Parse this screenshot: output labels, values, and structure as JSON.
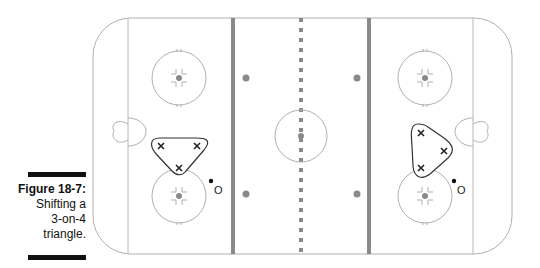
{
  "figure": {
    "label": "Figure 18-7:",
    "caption_lines": [
      "Shifting a",
      "3-on-4",
      "triangle."
    ]
  },
  "rink": {
    "line_color": "#aaaaaa",
    "blue_line_color": "#888888",
    "red_line_color": "#888888",
    "dot_color": "#888888"
  },
  "players": {
    "left_zone": {
      "offense": [
        "X",
        "X",
        "X"
      ],
      "defense_label": "O"
    },
    "right_zone": {
      "offense": [
        "X",
        "X",
        "X"
      ],
      "defense_label": "O"
    }
  }
}
